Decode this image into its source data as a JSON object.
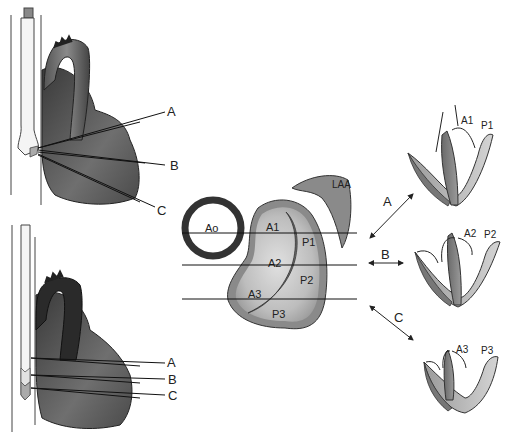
{
  "figure": {
    "type": "medical-diagram"
  },
  "top_heart": {
    "labels": [
      "A",
      "B",
      "C"
    ]
  },
  "bottom_heart": {
    "labels": [
      "A",
      "B",
      "C"
    ]
  },
  "valve_en_face": {
    "ao_label": "Ao",
    "laa_label": "LAA",
    "scallops": [
      "A1",
      "A2",
      "A3",
      "P1",
      "P2",
      "P3"
    ]
  },
  "arrows": [
    "A",
    "B",
    "C"
  ],
  "cross_sections": [
    {
      "plane": "A",
      "anterior": "A1",
      "posterior": "P1"
    },
    {
      "plane": "B",
      "anterior": "A2",
      "posterior": "P2"
    },
    {
      "plane": "C",
      "anterior": "A3",
      "posterior": "P3"
    }
  ],
  "colors": {
    "heart_dark": "#2a2a2a",
    "heart_mid": "#6e6e6e",
    "leaflet_dark": "#7a7a7a",
    "leaflet_light": "#b4b4b4",
    "valve_fill": "#c8c8c8",
    "valve_rim": "#8a8a8a"
  }
}
